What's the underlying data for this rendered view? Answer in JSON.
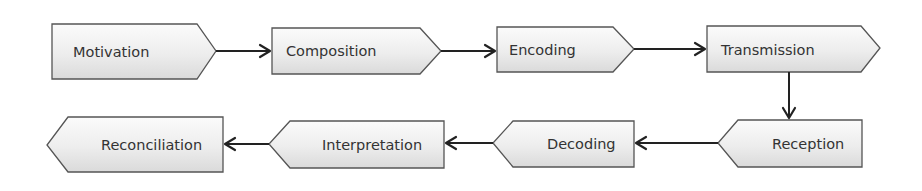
{
  "diagram": {
    "type": "process-flow",
    "colors": {
      "box_fill_top": "#fbfbfb",
      "box_fill_bottom": "#dedede",
      "box_border": "#555555",
      "text": "#333333",
      "arrow": "#222222"
    },
    "nodes": [
      {
        "id": "motivation",
        "label": "Motivation",
        "direction": "right",
        "row": 1
      },
      {
        "id": "composition",
        "label": "Composition",
        "direction": "right",
        "row": 1
      },
      {
        "id": "encoding",
        "label": "Encoding",
        "direction": "right",
        "row": 1
      },
      {
        "id": "transmission",
        "label": "Transmission",
        "direction": "right",
        "row": 1
      },
      {
        "id": "reception",
        "label": "Reception",
        "direction": "left",
        "row": 2
      },
      {
        "id": "decoding",
        "label": "Decoding",
        "direction": "left",
        "row": 2
      },
      {
        "id": "interpretation",
        "label": "Interpretation",
        "direction": "left",
        "row": 2
      },
      {
        "id": "reconciliation",
        "label": "Reconciliation",
        "direction": "left",
        "row": 2
      }
    ],
    "edges": [
      {
        "from": "motivation",
        "to": "composition"
      },
      {
        "from": "composition",
        "to": "encoding"
      },
      {
        "from": "encoding",
        "to": "transmission"
      },
      {
        "from": "transmission",
        "to": "reception"
      },
      {
        "from": "reception",
        "to": "decoding"
      },
      {
        "from": "decoding",
        "to": "interpretation"
      },
      {
        "from": "interpretation",
        "to": "reconciliation"
      }
    ]
  }
}
